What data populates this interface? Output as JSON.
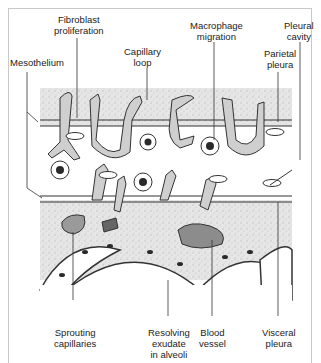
{
  "figure": {
    "type": "anatomical diagram",
    "labels": {
      "fibroblast": "Fibroblast\nproliferation",
      "capillary_loop": "Capillary\nloop",
      "macrophage": "Macrophage\nmigration",
      "pleural_cavity": "Pleural\ncavity",
      "parietal": "Parietal\npleura",
      "mesothelium": "Mesothelium",
      "sprouting": "Sprouting\ncapillaries",
      "resolving": "Resolving\nexudate\nin alveoli",
      "blood_vessel": "Blood\nvessel",
      "visceral": "Visceral\npleura"
    },
    "colors": {
      "stipple": "#d9d9d9",
      "line": "#333333",
      "cell_fill": "#cfcfcf",
      "nucleus": "#2a2a2a",
      "frame": "#c8c8c8"
    }
  }
}
